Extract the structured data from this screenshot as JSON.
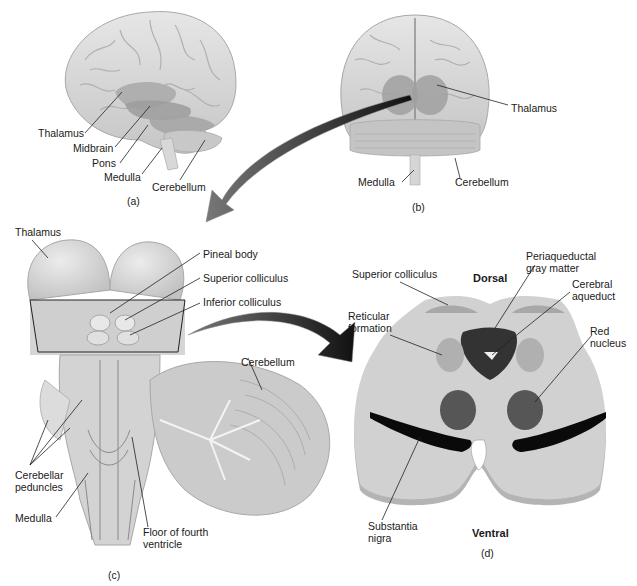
{
  "figure": {
    "panels": [
      {
        "id": "a",
        "caption": "(a)",
        "view": "lateral brain",
        "labels": [
          "Thalamus",
          "Midbrain",
          "Pons",
          "Medulla",
          "Cerebellum"
        ]
      },
      {
        "id": "b",
        "caption": "(b)",
        "view": "posterior brain",
        "labels": [
          "Thalamus",
          "Medulla",
          "Cerebellum"
        ]
      },
      {
        "id": "c",
        "caption": "(c)",
        "view": "dorsal brainstem",
        "labels": [
          "Thalamus",
          "Pineal body",
          "Superior colliculus",
          "Inferior colliculus",
          "Cerebellum",
          "Cerebellar peduncles",
          "Medulla",
          "Floor of fourth ventricle"
        ]
      },
      {
        "id": "d",
        "caption": "(d)",
        "view": "midbrain cross-section",
        "orientation": {
          "top": "Dorsal",
          "bottom": "Ventral"
        },
        "labels": [
          "Superior colliculus",
          "Periaqueductal gray matter",
          "Cerebral aqueduct",
          "Reticular formation",
          "Red nucleus",
          "Substantia nigra"
        ]
      }
    ]
  },
  "a": {
    "thalamus": "Thalamus",
    "midbrain": "Midbrain",
    "pons": "Pons",
    "medulla": "Medulla",
    "cerebellum": "Cerebellum",
    "caption": "(a)"
  },
  "b": {
    "thalamus": "Thalamus",
    "medulla": "Medulla",
    "cerebellum": "Cerebellum",
    "caption": "(b)"
  },
  "c": {
    "thalamus": "Thalamus",
    "pineal": "Pineal body",
    "sup_coll": "Superior colliculus",
    "inf_coll": "Inferior colliculus",
    "cerebellum": "Cerebellum",
    "peduncles": "Cerebellar peduncles",
    "medulla": "Medulla",
    "floor": "Floor of fourth ventricle",
    "caption": "(c)"
  },
  "d": {
    "dorsal": "Dorsal",
    "ventral": "Ventral",
    "sup_coll": "Superior colliculus",
    "pag": "Periaqueductal gray matter",
    "aqueduct": "Cerebral aqueduct",
    "reticular": "Reticular formation",
    "red": "Red nucleus",
    "nigra": "Substantia nigra",
    "caption": "(d)"
  },
  "colors": {
    "brain_fill": "#d9d9d9",
    "brain_shade": "#b5b5b5",
    "highlight": "#9e9e9e",
    "section_fill": "#cfcfcf",
    "section_edge": "#9a9a9a",
    "pag": "#333333",
    "red_nucleus": "#555555",
    "nigra": "#0a0a0a",
    "arrow": "#222222"
  }
}
